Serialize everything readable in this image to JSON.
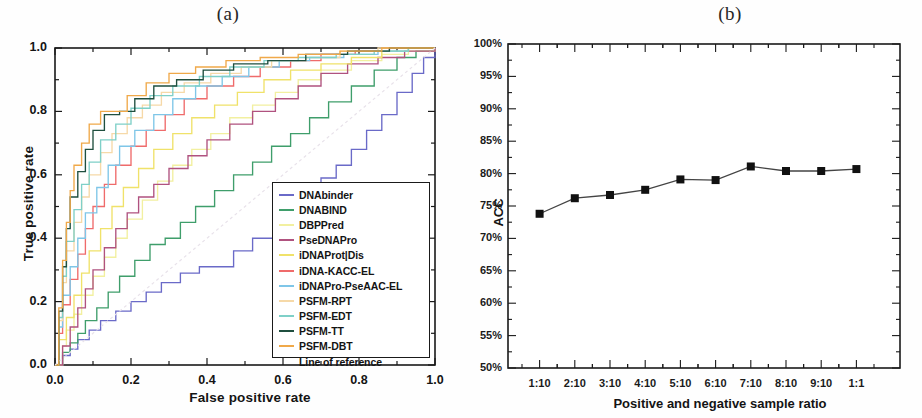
{
  "figure": {
    "panel_a_label": "(a)",
    "panel_b_label": "(b)"
  },
  "panel_a": {
    "xlabel": "False positive rate",
    "ylabel": "True positive rate",
    "xticks": [
      "0.0",
      "0.2",
      "0.4",
      "0.6",
      "0.8",
      "1.0"
    ],
    "yticks": [
      "0.0",
      "0.2",
      "0.4",
      "0.6",
      "0.8",
      "1.0"
    ],
    "legend": [
      {
        "label": "DNAbinder",
        "color": "#6a6ac8"
      },
      {
        "label": "DNABIND",
        "color": "#3f9e6b"
      },
      {
        "label": "DBPPred",
        "color": "#f2f0a0"
      },
      {
        "label": "PseDNAPro",
        "color": "#b0527f"
      },
      {
        "label": "iDNAProt|Dis",
        "color": "#f0e26a"
      },
      {
        "label": "iDNA-KACC-EL",
        "color": "#ef6b6b"
      },
      {
        "label": "iDNAPro-PseAAC-EL",
        "color": "#7fc6e8"
      },
      {
        "label": "PSFM-RPT",
        "color": "#f6d9a8"
      },
      {
        "label": "PSFM-EDT",
        "color": "#7fd0c8"
      },
      {
        "label": "PSFM-TT",
        "color": "#1f4f3f"
      },
      {
        "label": "PSFM-DBT",
        "color": "#f0a94a"
      },
      {
        "label": "Line of reference",
        "color": "#e8e2ea"
      }
    ]
  },
  "panel_b": {
    "xlabel": "Positive and negative sample ratio",
    "ylabel": "ACC",
    "yticks": [
      "100%",
      "95%",
      "90%",
      "85%",
      "80%",
      "75%",
      "70%",
      "65%",
      "60%",
      "55%",
      "50%"
    ],
    "xticks": [
      "1:10",
      "2:10",
      "3:10",
      "4:10",
      "5:10",
      "6:10",
      "7:10",
      "8:10",
      "9:10",
      "1:1"
    ]
  },
  "chart_data": [
    {
      "type": "line",
      "title": "(a)",
      "xlabel": "False positive rate",
      "ylabel": "True positive rate",
      "xlim": [
        0.0,
        1.0
      ],
      "ylim": [
        0.0,
        1.0
      ],
      "grid": false,
      "legend_position": "lower-right",
      "note": "ROC curves (step functions) for ten DNA-binding protein predictors plus a diagonal line of reference.",
      "series": [
        {
          "name": "DNAbinder",
          "color": "#6a6ac8",
          "x": [
            0.0,
            0.02,
            0.04,
            0.06,
            0.09,
            0.12,
            0.16,
            0.2,
            0.24,
            0.28,
            0.33,
            0.38,
            0.42,
            0.47,
            0.52,
            0.58,
            0.62,
            0.66,
            0.7,
            0.74,
            0.78,
            0.82,
            0.86,
            0.9,
            0.94,
            0.97,
            1.0
          ],
          "y": [
            0.0,
            0.03,
            0.05,
            0.08,
            0.11,
            0.14,
            0.17,
            0.2,
            0.23,
            0.26,
            0.29,
            0.31,
            0.31,
            0.36,
            0.4,
            0.45,
            0.5,
            0.55,
            0.59,
            0.63,
            0.68,
            0.74,
            0.79,
            0.86,
            0.92,
            0.97,
            1.0
          ]
        },
        {
          "name": "DNABIND",
          "color": "#3f9e6b",
          "x": [
            0.0,
            0.02,
            0.04,
            0.06,
            0.08,
            0.11,
            0.14,
            0.17,
            0.21,
            0.25,
            0.29,
            0.33,
            0.37,
            0.42,
            0.47,
            0.52,
            0.57,
            0.62,
            0.67,
            0.72,
            0.78,
            0.84,
            0.9,
            0.95,
            1.0
          ],
          "y": [
            0.0,
            0.04,
            0.07,
            0.1,
            0.14,
            0.18,
            0.23,
            0.28,
            0.33,
            0.38,
            0.4,
            0.45,
            0.5,
            0.55,
            0.6,
            0.64,
            0.69,
            0.73,
            0.78,
            0.83,
            0.88,
            0.93,
            0.97,
            0.99,
            1.0
          ]
        },
        {
          "name": "DBPPred",
          "color": "#f2f0a0",
          "x": [
            0.0,
            0.02,
            0.03,
            0.05,
            0.07,
            0.1,
            0.13,
            0.16,
            0.19,
            0.23,
            0.27,
            0.31,
            0.36,
            0.41,
            0.46,
            0.52,
            0.58,
            0.64,
            0.7,
            0.78,
            0.86,
            0.93,
            1.0
          ],
          "y": [
            0.0,
            0.06,
            0.11,
            0.16,
            0.22,
            0.28,
            0.34,
            0.4,
            0.46,
            0.52,
            0.58,
            0.63,
            0.68,
            0.73,
            0.78,
            0.82,
            0.86,
            0.9,
            0.93,
            0.96,
            0.98,
            0.99,
            1.0
          ]
        },
        {
          "name": "PseDNAPro",
          "color": "#b0527f",
          "x": [
            0.0,
            0.02,
            0.04,
            0.06,
            0.08,
            0.1,
            0.13,
            0.16,
            0.19,
            0.22,
            0.26,
            0.3,
            0.35,
            0.4,
            0.46,
            0.52,
            0.58,
            0.64,
            0.7,
            0.77,
            0.85,
            0.92,
            1.0
          ],
          "y": [
            0.0,
            0.06,
            0.12,
            0.18,
            0.24,
            0.3,
            0.37,
            0.43,
            0.48,
            0.53,
            0.57,
            0.62,
            0.66,
            0.71,
            0.76,
            0.8,
            0.84,
            0.88,
            0.92,
            0.95,
            0.97,
            0.99,
            1.0
          ]
        },
        {
          "name": "iDNAProt|Dis",
          "color": "#f0e26a",
          "x": [
            0.0,
            0.01,
            0.03,
            0.05,
            0.07,
            0.09,
            0.12,
            0.15,
            0.18,
            0.22,
            0.26,
            0.31,
            0.36,
            0.42,
            0.48,
            0.55,
            0.62,
            0.7,
            0.78,
            0.86,
            0.93,
            1.0
          ],
          "y": [
            0.0,
            0.08,
            0.15,
            0.22,
            0.29,
            0.36,
            0.43,
            0.5,
            0.56,
            0.62,
            0.68,
            0.73,
            0.78,
            0.82,
            0.86,
            0.9,
            0.93,
            0.95,
            0.97,
            0.99,
            1.0,
            1.0
          ]
        },
        {
          "name": "iDNA-KACC-EL",
          "color": "#ef6b6b",
          "x": [
            0.0,
            0.01,
            0.02,
            0.04,
            0.06,
            0.08,
            0.1,
            0.13,
            0.16,
            0.2,
            0.24,
            0.29,
            0.34,
            0.4,
            0.47,
            0.54,
            0.62,
            0.7,
            0.79,
            0.88,
            0.95,
            1.0
          ],
          "y": [
            0.0,
            0.1,
            0.19,
            0.27,
            0.35,
            0.43,
            0.5,
            0.57,
            0.63,
            0.69,
            0.74,
            0.79,
            0.84,
            0.88,
            0.91,
            0.94,
            0.96,
            0.98,
            0.99,
            1.0,
            1.0,
            1.0
          ]
        },
        {
          "name": "iDNAPro-PseAAC-EL",
          "color": "#7fc6e8",
          "x": [
            0.0,
            0.01,
            0.02,
            0.04,
            0.06,
            0.08,
            0.11,
            0.14,
            0.17,
            0.21,
            0.26,
            0.31,
            0.37,
            0.44,
            0.51,
            0.59,
            0.67,
            0.76,
            0.85,
            0.93,
            1.0
          ],
          "y": [
            0.0,
            0.12,
            0.22,
            0.31,
            0.4,
            0.48,
            0.56,
            0.63,
            0.69,
            0.74,
            0.79,
            0.84,
            0.88,
            0.91,
            0.94,
            0.96,
            0.97,
            0.98,
            0.99,
            1.0,
            1.0
          ]
        },
        {
          "name": "PSFM-RPT",
          "color": "#f6d9a8",
          "x": [
            0.0,
            0.01,
            0.02,
            0.03,
            0.05,
            0.07,
            0.09,
            0.12,
            0.15,
            0.19,
            0.23,
            0.28,
            0.34,
            0.41,
            0.49,
            0.57,
            0.66,
            0.75,
            0.85,
            0.94,
            1.0
          ],
          "y": [
            0.0,
            0.14,
            0.26,
            0.36,
            0.45,
            0.53,
            0.6,
            0.67,
            0.73,
            0.78,
            0.82,
            0.86,
            0.89,
            0.92,
            0.94,
            0.96,
            0.97,
            0.99,
            1.0,
            1.0,
            1.0
          ]
        },
        {
          "name": "PSFM-EDT",
          "color": "#7fd0c8",
          "x": [
            0.0,
            0.01,
            0.02,
            0.03,
            0.05,
            0.07,
            0.09,
            0.12,
            0.16,
            0.2,
            0.25,
            0.31,
            0.38,
            0.46,
            0.55,
            0.64,
            0.74,
            0.84,
            0.93,
            1.0
          ],
          "y": [
            0.0,
            0.15,
            0.28,
            0.39,
            0.49,
            0.57,
            0.64,
            0.71,
            0.76,
            0.81,
            0.85,
            0.88,
            0.91,
            0.94,
            0.96,
            0.97,
            0.98,
            0.99,
            1.0,
            1.0
          ]
        },
        {
          "name": "PSFM-TT",
          "color": "#1f4f3f",
          "x": [
            0.0,
            0.01,
            0.02,
            0.03,
            0.04,
            0.06,
            0.08,
            0.1,
            0.13,
            0.17,
            0.21,
            0.26,
            0.32,
            0.39,
            0.47,
            0.56,
            0.66,
            0.77,
            0.88,
            0.96,
            1.0
          ],
          "y": [
            0.0,
            0.17,
            0.31,
            0.43,
            0.53,
            0.61,
            0.68,
            0.74,
            0.79,
            0.8,
            0.84,
            0.88,
            0.9,
            0.93,
            0.95,
            0.96,
            0.98,
            0.99,
            1.0,
            1.0,
            1.0
          ]
        },
        {
          "name": "PSFM-DBT",
          "color": "#f0a94a",
          "x": [
            0.0,
            0.01,
            0.02,
            0.03,
            0.04,
            0.05,
            0.07,
            0.09,
            0.12,
            0.15,
            0.19,
            0.24,
            0.3,
            0.37,
            0.45,
            0.54,
            0.64,
            0.75,
            0.86,
            0.95,
            1.0
          ],
          "y": [
            0.0,
            0.18,
            0.33,
            0.45,
            0.55,
            0.63,
            0.7,
            0.76,
            0.8,
            0.8,
            0.85,
            0.89,
            0.92,
            0.94,
            0.96,
            0.97,
            0.98,
            0.99,
            1.0,
            1.0,
            1.0
          ]
        },
        {
          "name": "Line of reference",
          "color": "#e8e2ea",
          "x": [
            0.0,
            1.0
          ],
          "y": [
            0.0,
            1.0
          ]
        }
      ]
    },
    {
      "type": "line",
      "title": "(b)",
      "xlabel": "Positive and negative sample ratio",
      "ylabel": "ACC",
      "categories": [
        "1:10",
        "2:10",
        "3:10",
        "4:10",
        "5:10",
        "6:10",
        "7:10",
        "8:10",
        "9:10",
        "1:1"
      ],
      "values": [
        73.8,
        76.2,
        76.7,
        77.5,
        79.1,
        79.0,
        81.1,
        80.4,
        80.4,
        80.7
      ],
      "ylim": [
        50,
        100
      ],
      "ytick_step": 5,
      "grid": false,
      "marker": "square",
      "marker_color": "#111111",
      "line_color": "#444444"
    }
  ]
}
